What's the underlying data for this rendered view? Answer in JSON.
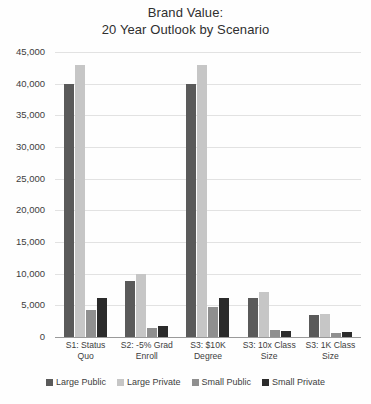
{
  "chart_data": {
    "type": "bar",
    "title": "Brand Value:  20 Year Outlook by Scenario",
    "title_lines": [
      "Brand Value:",
      "20 Year Outlook by Scenario"
    ],
    "xlabel": "",
    "ylabel": "",
    "ylim": [
      0,
      45000
    ],
    "ytick_step": 5000,
    "grid": true,
    "legend_position": "bottom",
    "categories": [
      "S1: Status Quo",
      "S2: -5% Grad Enroll",
      "S3: $10K Degree",
      "S3: 10x Class Size",
      "S3: 1K Class Size"
    ],
    "category_lines": [
      [
        "S1: Status",
        "Quo"
      ],
      [
        "S2: -5% Grad",
        "Enroll"
      ],
      [
        "S3: $10K",
        "Degree"
      ],
      [
        "S3: 10x Class",
        "Size"
      ],
      [
        "S3: 1K Class",
        "Size"
      ]
    ],
    "ytick_labels": [
      "0",
      "5,000",
      "10,000",
      "15,000",
      "20,000",
      "25,000",
      "30,000",
      "35,000",
      "40,000",
      "45,000"
    ],
    "ytick_values": [
      0,
      5000,
      10000,
      15000,
      20000,
      25000,
      30000,
      35000,
      40000,
      45000
    ],
    "series": [
      {
        "name": "Large Public",
        "color": "#5a5a5a",
        "values": [
          40000,
          8900,
          40000,
          6100,
          3400
        ]
      },
      {
        "name": "Large Private",
        "color": "#c6c6c6",
        "values": [
          43000,
          10000,
          43000,
          7100,
          3600
        ]
      },
      {
        "name": "Small Public",
        "color": "#8f8f8f",
        "values": [
          4200,
          1400,
          4700,
          1100,
          600
        ]
      },
      {
        "name": "Small Private",
        "color": "#2b2b2b",
        "values": [
          6100,
          1700,
          6200,
          900,
          800
        ]
      }
    ]
  }
}
